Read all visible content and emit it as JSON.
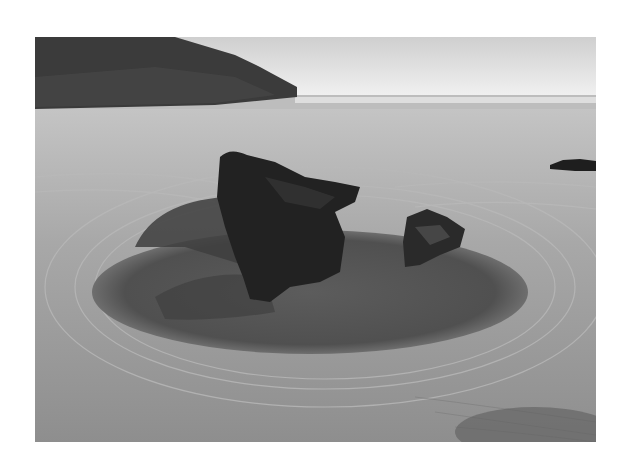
{
  "image": {
    "description": "Black-and-white photograph of a sandy beach with a dark rock formation standing in a shallow oval tide pool, rippled sand around it, a headland cliff at upper left and the sea on the horizon",
    "style": "monochrome",
    "colors": {
      "background": "#ffffff",
      "sky": "#e6e6e6",
      "cliff": "#3a3a3a",
      "sea": "#b8b8b8",
      "sand": "#a6a6a6",
      "pool": "#5a5a5a",
      "rock": "#222222"
    }
  }
}
